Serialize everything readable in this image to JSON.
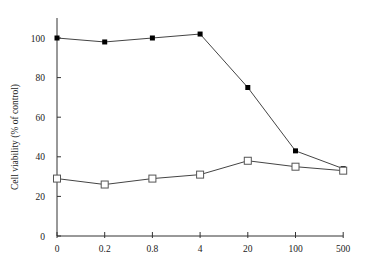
{
  "chart_data": {
    "type": "line",
    "title": "",
    "xlabel": "",
    "ylabel": "Cell viability (% of control)",
    "categories": [
      "0",
      "0.2",
      "0.8",
      "4",
      "20",
      "100",
      "500"
    ],
    "ylim": [
      0,
      110
    ],
    "yticks": [
      0,
      20,
      40,
      60,
      80,
      100
    ],
    "grid": false,
    "legend": null,
    "series": [
      {
        "name": "filled squares",
        "marker": "filled-square",
        "color": "#000000",
        "values": [
          100,
          98,
          100,
          102,
          75,
          43,
          34
        ]
      },
      {
        "name": "open squares",
        "marker": "open-square",
        "color": "#000000",
        "values": [
          29,
          26,
          29,
          31,
          38,
          35,
          33
        ]
      }
    ]
  }
}
